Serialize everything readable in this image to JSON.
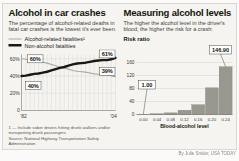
{
  "frame": {
    "credit": "By Julie Snider, USA TODAY"
  },
  "left_panel": {
    "title": "Alcohol in car crashes",
    "subtitle": "The percentage of alcohol-related deaths in fatal car crashes is the lowest it's ever been.",
    "legend": [
      {
        "label": "Alcohol-related fatalities¹"
      },
      {
        "label": "Non-alcohol fatalities"
      }
    ],
    "footnote": "1 — Include sober drivers hitting drunk walkers and/or transporting drunk passengers",
    "source": "Source: National Highway Transportation Safety Administration"
  },
  "right_panel": {
    "title": "Measuring alcohol levels",
    "subtitle": "The higher the alcohol level in the driver's blood, the higher the risk for a crash:",
    "risk_ratio_label": "Risk ratio"
  },
  "chart_data": [
    {
      "type": "line",
      "title": "Alcohol in car crashes",
      "x_range_years": [
        1982,
        2004
      ],
      "x_tick_labels": [
        "'82",
        "'04"
      ],
      "y_ticks": [
        0,
        20,
        40,
        60
      ],
      "y_tick_labels": [
        "0",
        "20%",
        "40%",
        "60%"
      ],
      "ylim": [
        0,
        65
      ],
      "grid": true,
      "series": [
        {
          "name": "Alcohol-related fatalities",
          "color": "#a9a9a3",
          "stroke_width": 1.1,
          "start_label": "60%",
          "end_label": "39%",
          "values": [
            60,
            59.5,
            58.5,
            57.5,
            57,
            56,
            55,
            53.5,
            52,
            50.5,
            49.5,
            48,
            46.5,
            45.5,
            45,
            44.5,
            43.5,
            42.5,
            42,
            41.5,
            41.5,
            40.5,
            39
          ]
        },
        {
          "name": "Non-alcohol fatalities",
          "color": "#191914",
          "stroke_width": 2.4,
          "start_label": "40%",
          "end_label": "61%",
          "values": [
            40,
            40.5,
            41.5,
            42.5,
            43,
            44,
            45,
            46.5,
            48,
            49.5,
            50.5,
            52,
            53.5,
            54.5,
            55,
            55.5,
            56.5,
            57.5,
            58,
            58.5,
            58.5,
            59.5,
            61
          ]
        }
      ]
    },
    {
      "type": "bar",
      "title": "Measuring alcohol levels",
      "ylabel": "Risk ratio",
      "xlabel": "Blood-alcohol level",
      "categories": [
        "0.00",
        "0.04",
        "0.08",
        "0.12",
        "0.16",
        "0.20",
        "0.24"
      ],
      "values": [
        1.0,
        2.4,
        5,
        13,
        30,
        82,
        146.9
      ],
      "y_ticks": [
        0,
        40,
        80,
        120,
        160
      ],
      "ylim": [
        0,
        165
      ],
      "bar_color": "#98988f",
      "callouts": [
        {
          "index": 0,
          "label": "1.00"
        },
        {
          "index": 6,
          "label": "146.90"
        }
      ]
    }
  ]
}
